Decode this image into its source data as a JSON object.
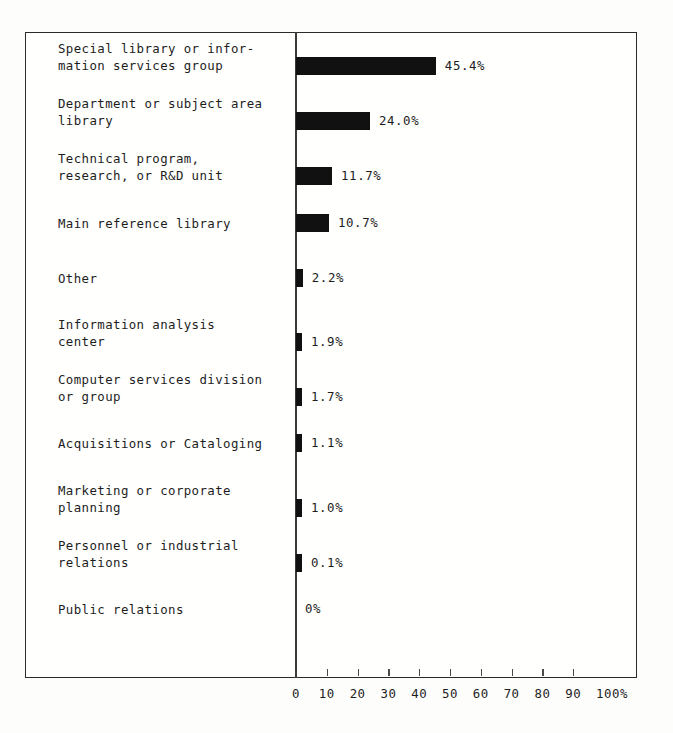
{
  "chart_data": {
    "type": "bar",
    "orientation": "horizontal",
    "title": "",
    "xlabel": "",
    "ylabel": "",
    "xlim": [
      0,
      100
    ],
    "grid": false,
    "legend": null,
    "bar_color": "#111111",
    "axis_color": "#2b2b2b",
    "categories": [
      "Special library or infor-\nmation services group",
      "Department or subject area\nlibrary",
      "Technical program,\nresearch, or R&D unit",
      "Main reference library",
      "Other",
      "Information analysis\ncenter",
      "Computer services division\nor group",
      "Acquisitions or Cataloging",
      "Marketing or corporate\nplanning",
      "Personnel or industrial\nrelations",
      "Public relations"
    ],
    "values": [
      45.4,
      24.0,
      11.7,
      10.7,
      2.2,
      1.9,
      1.7,
      1.1,
      1.0,
      0.1,
      0
    ],
    "value_labels": [
      "45.4%",
      "24.0%",
      "11.7%",
      "10.7%",
      "2.2%",
      "1.9%",
      "1.7%",
      "1.1%",
      "1.0%",
      "0.1%",
      "0%"
    ],
    "xticks": [
      0,
      10,
      20,
      30,
      40,
      50,
      60,
      70,
      80,
      90,
      100
    ],
    "xtick_labels": [
      "0",
      "10",
      "20",
      "30",
      "40",
      "50",
      "60",
      "70",
      "80",
      "90",
      "100%"
    ]
  }
}
